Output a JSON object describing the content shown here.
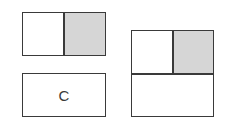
{
  "figure": {
    "top_left_box": {
      "left_cell_shaded": false,
      "right_cell_shaded": true
    },
    "bottom_left_box": {
      "label": "C"
    },
    "right_box": {
      "top_left_cell_shaded": false,
      "top_right_cell_shaded": true,
      "bottom_cell_shaded": false
    },
    "colors": {
      "stroke": "#3a3a3a",
      "shade": "#d6d6d6",
      "background": "#ffffff"
    }
  }
}
